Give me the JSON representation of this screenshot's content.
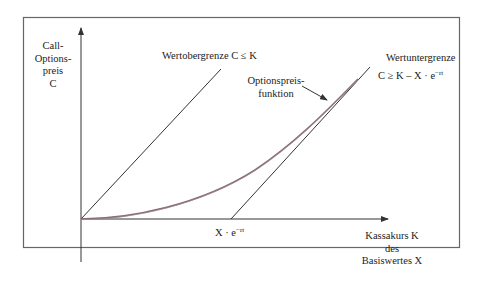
{
  "diagram": {
    "type": "call-option-price-bounds",
    "y_axis": {
      "label_lines": [
        "Call-",
        "Options-",
        "preis",
        "C"
      ]
    },
    "x_axis": {
      "label_lines": [
        "Kassakurs K",
        "des",
        "Basiswertes X"
      ],
      "tick_label_base": "X · e",
      "tick_label_exp": "−rt"
    },
    "upper_bound": {
      "label": "Wertobergrenze C ≤ K"
    },
    "lower_bound": {
      "label": "Wertuntergrenze",
      "formula_base": "C ≥ K – X · e",
      "formula_exp": "−rt"
    },
    "price_function": {
      "label_lines": [
        "Optionspreis-",
        "funktion"
      ]
    },
    "colors": {
      "frame": "#555555",
      "axes": "#333333",
      "bound_lines": "#333333",
      "curve": "#8a6a72"
    }
  }
}
